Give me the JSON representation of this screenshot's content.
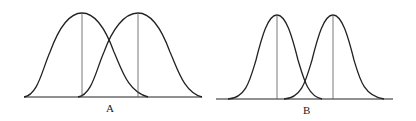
{
  "figure": {
    "panels": [
      {
        "label": "A",
        "description": "Two overlapping wide normal curves with vertical mean lines"
      },
      {
        "label": "B",
        "description": "Two narrower normal curves with vertical mean lines, less overlap"
      }
    ],
    "colors": {
      "stroke": "#222222",
      "mean_line": "#555555",
      "background": "#ffffff"
    }
  }
}
